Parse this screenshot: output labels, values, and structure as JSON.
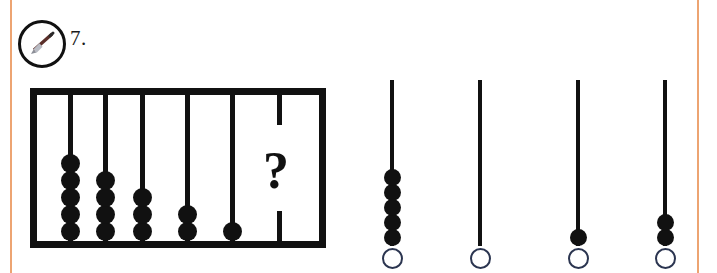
{
  "page": {
    "background_color": "#ffffff",
    "margin_rule_color": "#eda472",
    "ink_color": "#111111"
  },
  "question": {
    "number_label": "7.",
    "badge_icon": "pencil-icon",
    "prompt_symbol": "?"
  },
  "abacus": {
    "frame_color": "#111111",
    "rod_count": 6,
    "rods": [
      {
        "index": 1,
        "beads": 5,
        "label": "rod-1"
      },
      {
        "index": 2,
        "beads": 4,
        "label": "rod-2"
      },
      {
        "index": 3,
        "beads": 3,
        "label": "rod-3"
      },
      {
        "index": 4,
        "beads": 2,
        "label": "rod-4"
      },
      {
        "index": 5,
        "beads": 1,
        "label": "rod-5"
      },
      {
        "index": 6,
        "beads": 0,
        "label": "rod-6-unknown",
        "unknown": true
      }
    ]
  },
  "options": [
    {
      "id": "A",
      "beads": 5,
      "selected": false
    },
    {
      "id": "B",
      "beads": 0,
      "selected": false
    },
    {
      "id": "C",
      "beads": 1,
      "selected": false
    },
    {
      "id": "D",
      "beads": 2,
      "selected": false
    }
  ]
}
